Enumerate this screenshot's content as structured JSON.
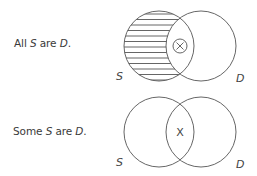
{
  "diagrams": [
    {
      "id": "universal-affirmative",
      "statement": {
        "prefix": "All ",
        "subject": "S",
        "middle": " are ",
        "predicate": "D",
        "suffix": "."
      },
      "left_label": "S",
      "right_label": "D",
      "shaded_region": "S-only",
      "marker": "⊗",
      "marker_meaning": "circled-x"
    },
    {
      "id": "particular-affirmative",
      "statement": {
        "prefix": "Some ",
        "subject": "S",
        "middle": " are ",
        "predicate": "D",
        "suffix": "."
      },
      "left_label": "S",
      "right_label": "D",
      "shaded_region": "none",
      "marker": "X",
      "marker_meaning": "x"
    }
  ],
  "colors": {
    "stroke": "#555555",
    "text": "#3a3a3a"
  }
}
